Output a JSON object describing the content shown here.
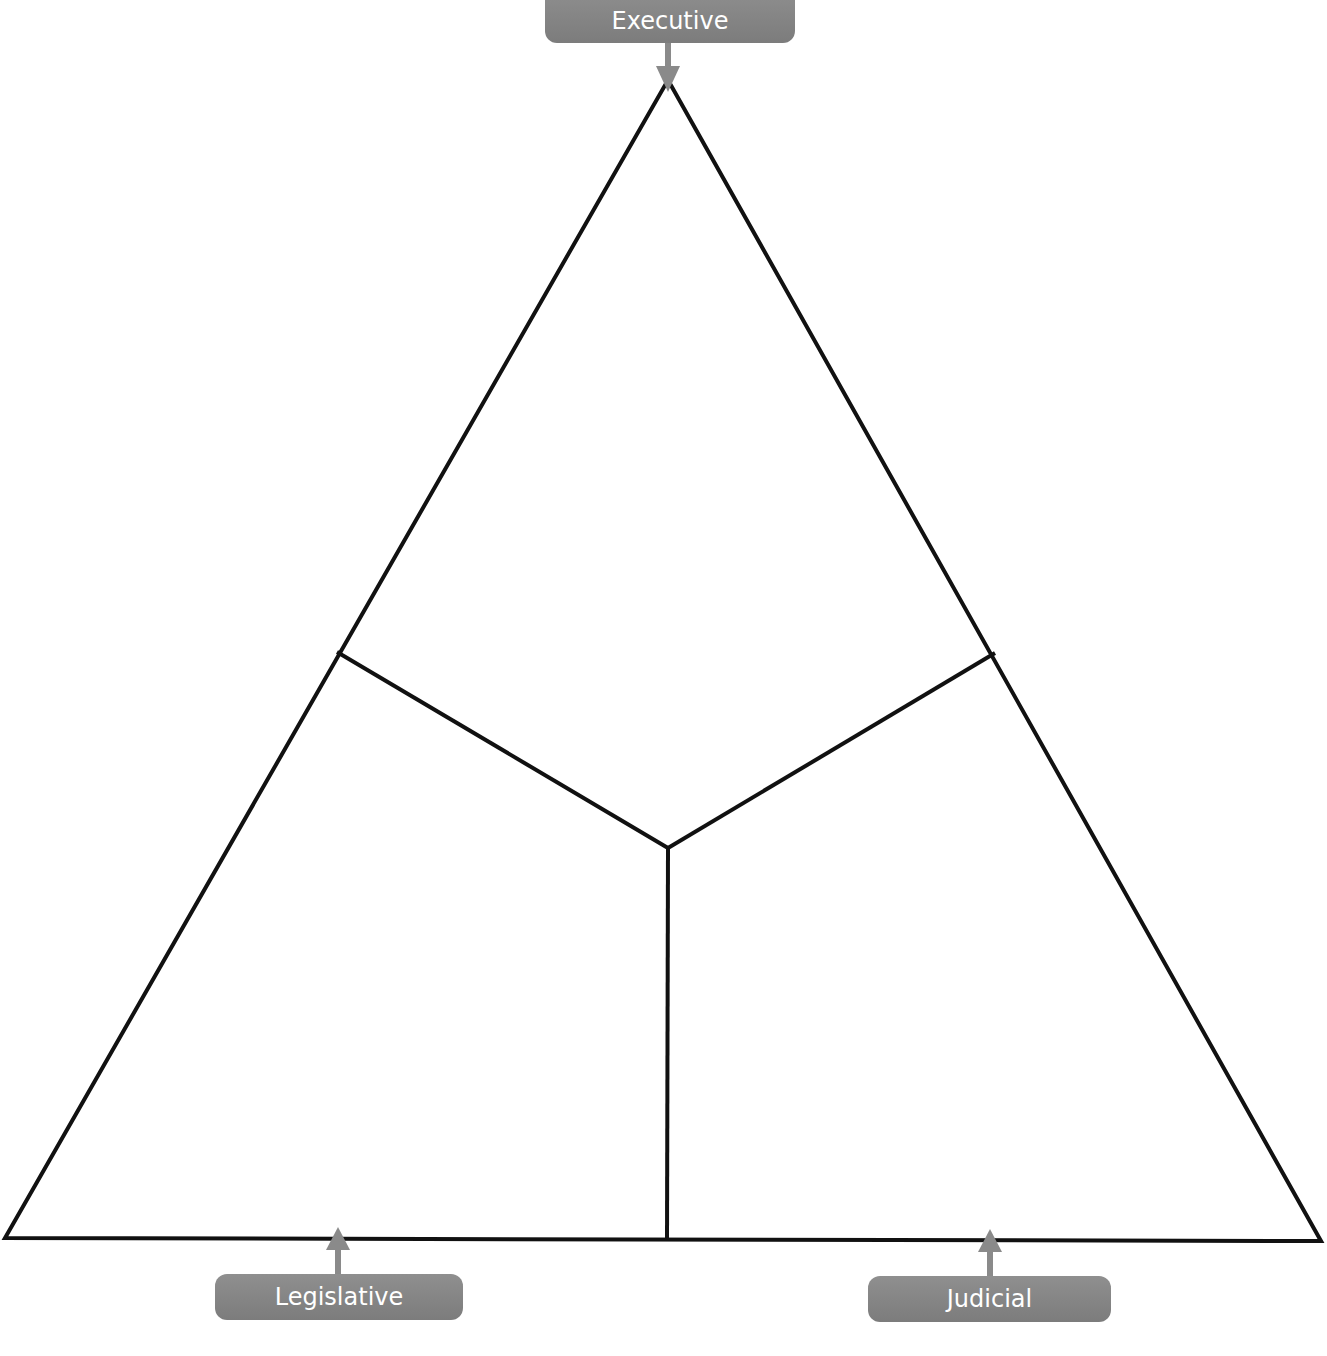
{
  "diagram": {
    "line_color": "#111111",
    "label_color": "#858585",
    "label_text_color": "#ffffff",
    "labels": {
      "top": "Executive",
      "bottom_left": "Legislative",
      "bottom_right": "Judicial"
    },
    "geometry": {
      "apex": [
        668,
        80
      ],
      "bottom_left": [
        5,
        1238
      ],
      "bottom_right": [
        1321,
        1241
      ],
      "center": [
        668,
        848
      ],
      "left_mid": [
        337,
        652
      ],
      "right_mid": [
        995,
        653
      ],
      "bottom_mid": [
        667,
        1239
      ]
    }
  }
}
